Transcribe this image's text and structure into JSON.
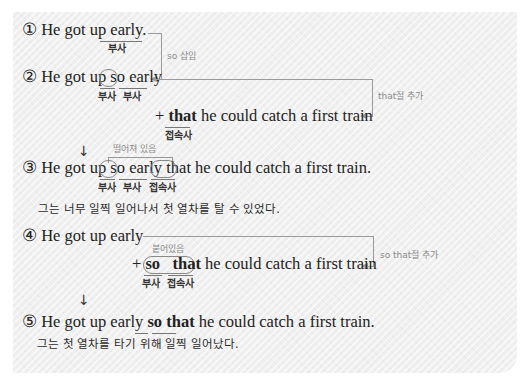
{
  "step1": {
    "number": "①",
    "prefix": "He got up ",
    "word": "early.",
    "label_early": "부사",
    "note": "so 삽입"
  },
  "step2": {
    "number": "②",
    "prefix": "He got up ",
    "word_so": "so",
    "word_early": "early",
    "label_so": "부사",
    "label_early": "부사",
    "add_plus": "+ ",
    "add_that": "that",
    "add_rest": " he could catch a first train",
    "label_that": "접속사",
    "note": "that절 추가"
  },
  "step3": {
    "number": "③",
    "prefix": "He got up ",
    "word_so": "so",
    "word_early": "early",
    "word_that": "that",
    "rest": " he could catch a first train.",
    "label_so": "부사",
    "label_early": "부사",
    "label_that": "접속사",
    "note": "떨어져 있음",
    "translation": "그는 너무 일찍 일어나서 첫 열차를 탈 수 있었다."
  },
  "step4": {
    "number": "④",
    "text": "He got up early",
    "add_plus": "+ ",
    "add_so": "so",
    "add_that": "that",
    "add_rest": " he could catch a first train",
    "label_so": "부사",
    "label_that": "접속사",
    "note_attached": "붙어있음",
    "note": "so that절 추가"
  },
  "step5": {
    "number": "⑤",
    "prefix": "He got up early ",
    "word_so": "so",
    "word_that": "that",
    "rest": " he could catch a first train.",
    "translation": "그는 첫 열차를 타기 위해 일찍 일어났다."
  },
  "arrows": {
    "down": "↓"
  }
}
